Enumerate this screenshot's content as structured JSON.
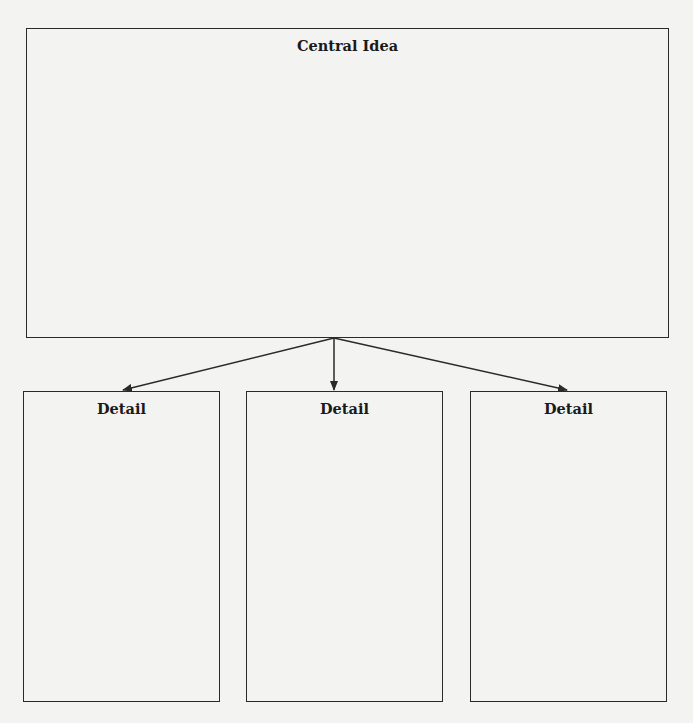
{
  "diagram": {
    "type": "concept-map",
    "central": {
      "label": "Central Idea"
    },
    "details": [
      {
        "label": "Detail"
      },
      {
        "label": "Detail"
      },
      {
        "label": "Detail"
      }
    ],
    "edges": [
      {
        "from": "central",
        "to": "detail-1"
      },
      {
        "from": "central",
        "to": "detail-2"
      },
      {
        "from": "central",
        "to": "detail-3"
      }
    ],
    "colors": {
      "line": "#2a2a2a",
      "background": "#f3f3f1"
    }
  }
}
